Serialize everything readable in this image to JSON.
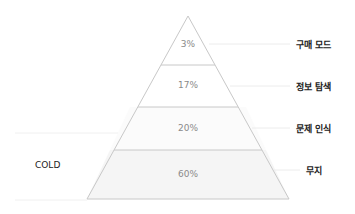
{
  "diagram": {
    "type": "pyramid",
    "side_label": "COLD",
    "levels": [
      {
        "value": "3%",
        "label": "구매 모드"
      },
      {
        "value": "17%",
        "label": "정보 탐색"
      },
      {
        "value": "20%",
        "label": "문제 인식"
      },
      {
        "value": "60%",
        "label": "무지"
      }
    ]
  },
  "colors": {
    "outline": "#c8c8c8",
    "base_fill": "#f4f4f4",
    "percent_text": "#8a8a8a",
    "label_text": "#222222"
  }
}
